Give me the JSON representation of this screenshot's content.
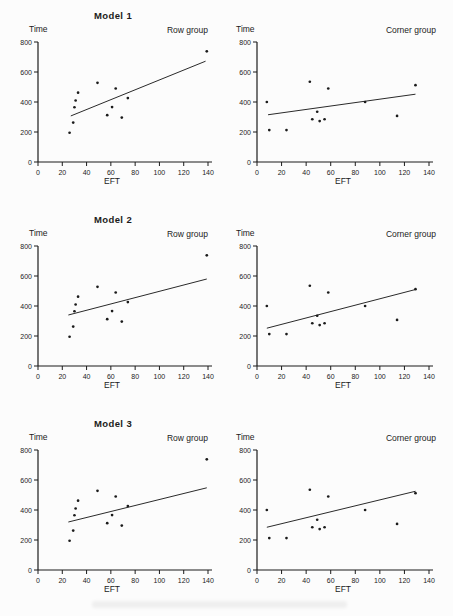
{
  "colors": {
    "ink": "#1b1b1b",
    "paper": "#fcfcfc"
  },
  "axes": {
    "x_ticks": [
      0,
      20,
      40,
      60,
      80,
      100,
      120,
      140
    ],
    "y_ticks": [
      0,
      200,
      400,
      600,
      800
    ],
    "x_max": 140,
    "y_max": 800
  },
  "chart_data": [
    {
      "type": "scatter",
      "title": "Model 1",
      "group": "Row group",
      "xlabel": "EFT",
      "ylabel": "Time",
      "xlim": [
        0,
        140
      ],
      "ylim": [
        0,
        800
      ],
      "points": [
        [
          26,
          195
        ],
        [
          29,
          263
        ],
        [
          30,
          365
        ],
        [
          31,
          410
        ],
        [
          33,
          462
        ],
        [
          49,
          528
        ],
        [
          57,
          312
        ],
        [
          61,
          366
        ],
        [
          64,
          490
        ],
        [
          69,
          296
        ],
        [
          74,
          426
        ],
        [
          139,
          738
        ]
      ],
      "fit_line": [
        [
          27,
          307
        ],
        [
          138,
          672
        ]
      ]
    },
    {
      "type": "scatter",
      "title": "",
      "group": "Corner group",
      "xlabel": "EFT",
      "ylabel": "Time",
      "xlim": [
        0,
        140
      ],
      "ylim": [
        0,
        800
      ],
      "points": [
        [
          8,
          400
        ],
        [
          10,
          213
        ],
        [
          24,
          213
        ],
        [
          43,
          535
        ],
        [
          45,
          285
        ],
        [
          49,
          335
        ],
        [
          51,
          273
        ],
        [
          55,
          285
        ],
        [
          58,
          490
        ],
        [
          88,
          400
        ],
        [
          114,
          307
        ],
        [
          129,
          512
        ]
      ],
      "fit_line": [
        [
          9,
          315
        ],
        [
          129,
          452
        ]
      ]
    },
    {
      "type": "scatter",
      "title": "Model 2",
      "group": "Row group",
      "xlabel": "EFT",
      "ylabel": "Time",
      "xlim": [
        0,
        140
      ],
      "ylim": [
        0,
        800
      ],
      "points": [
        [
          26,
          195
        ],
        [
          29,
          263
        ],
        [
          30,
          365
        ],
        [
          31,
          410
        ],
        [
          33,
          462
        ],
        [
          49,
          528
        ],
        [
          57,
          312
        ],
        [
          61,
          366
        ],
        [
          64,
          490
        ],
        [
          69,
          296
        ],
        [
          74,
          426
        ],
        [
          139,
          738
        ]
      ],
      "fit_line": [
        [
          25,
          340
        ],
        [
          139,
          580
        ]
      ]
    },
    {
      "type": "scatter",
      "title": "",
      "group": "Corner group",
      "xlabel": "EFT",
      "ylabel": "Time",
      "xlim": [
        0,
        140
      ],
      "ylim": [
        0,
        800
      ],
      "points": [
        [
          8,
          400
        ],
        [
          10,
          213
        ],
        [
          24,
          213
        ],
        [
          43,
          535
        ],
        [
          45,
          285
        ],
        [
          49,
          335
        ],
        [
          51,
          273
        ],
        [
          55,
          285
        ],
        [
          58,
          490
        ],
        [
          88,
          400
        ],
        [
          114,
          307
        ],
        [
          129,
          512
        ]
      ],
      "fit_line": [
        [
          8,
          252
        ],
        [
          129,
          510
        ]
      ]
    },
    {
      "type": "scatter",
      "title": "Model 3",
      "group": "Row group",
      "xlabel": "EFT",
      "ylabel": "Time",
      "xlim": [
        0,
        140
      ],
      "ylim": [
        0,
        800
      ],
      "points": [
        [
          26,
          195
        ],
        [
          29,
          263
        ],
        [
          30,
          365
        ],
        [
          31,
          410
        ],
        [
          33,
          462
        ],
        [
          49,
          528
        ],
        [
          57,
          312
        ],
        [
          61,
          366
        ],
        [
          64,
          490
        ],
        [
          69,
          296
        ],
        [
          74,
          426
        ],
        [
          139,
          738
        ]
      ],
      "fit_line": [
        [
          25,
          320
        ],
        [
          139,
          548
        ]
      ]
    },
    {
      "type": "scatter",
      "title": "",
      "group": "Corner group",
      "xlabel": "EFT",
      "ylabel": "Time",
      "xlim": [
        0,
        140
      ],
      "ylim": [
        0,
        800
      ],
      "points": [
        [
          8,
          400
        ],
        [
          10,
          213
        ],
        [
          24,
          213
        ],
        [
          43,
          535
        ],
        [
          45,
          285
        ],
        [
          49,
          335
        ],
        [
          51,
          273
        ],
        [
          55,
          285
        ],
        [
          58,
          490
        ],
        [
          88,
          400
        ],
        [
          114,
          307
        ],
        [
          129,
          512
        ]
      ],
      "fit_line": [
        [
          8,
          285
        ],
        [
          129,
          525
        ]
      ]
    }
  ]
}
